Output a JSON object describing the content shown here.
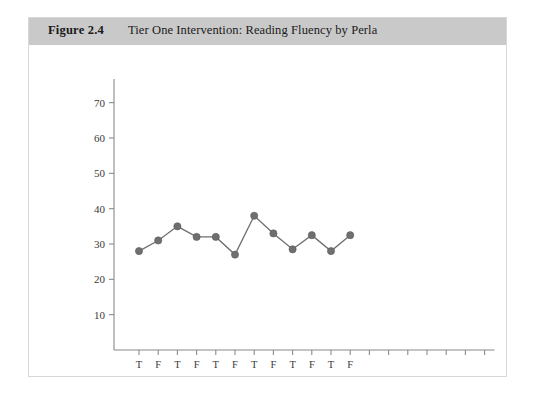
{
  "figure": {
    "number": "Figure 2.4",
    "title": "Tier One Intervention: Reading Fluency by Perla"
  },
  "colors": {
    "header_band": "#c9c9c9",
    "series": "#6f6f6f",
    "axis": "#8a8a8a",
    "card_border": "#d8d8d8",
    "background": "#ffffff"
  },
  "chart_data": {
    "type": "line",
    "title": "Tier One Intervention: Reading Fluency by Perla",
    "xlabel": "",
    "ylabel": "",
    "ylim": [
      0,
      75
    ],
    "yticks": [
      10,
      20,
      30,
      40,
      50,
      60,
      70
    ],
    "ytick_labels": [
      "10",
      "20",
      "30",
      "40",
      "50",
      "60",
      "70"
    ],
    "grid": false,
    "legend": "none",
    "x_tick_labels": [
      "T",
      "F",
      "T",
      "F",
      "T",
      "F",
      "T",
      "F",
      "T",
      "F",
      "T",
      "F"
    ],
    "x_unlabeled_tick_count": 7,
    "x_total_ticks": 19,
    "categories": [
      "T",
      "F",
      "T",
      "F",
      "T",
      "F",
      "T",
      "F",
      "T",
      "F",
      "T",
      "F"
    ],
    "values": [
      28,
      31,
      35,
      32,
      32,
      27,
      38,
      33,
      28.5,
      32.5,
      28,
      32.5
    ],
    "point_count": 12,
    "marker": "circle"
  }
}
